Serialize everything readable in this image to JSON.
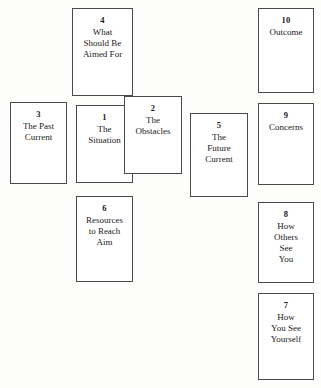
{
  "spread": {
    "background_color": "#fdfdfc",
    "card_border_color": "#4a4a4a",
    "card_fill_color": "#ffffff",
    "text_color": "#1a1a1a",
    "cards": [
      {
        "id": "card-1",
        "number": "1",
        "label": "The\nSituation"
      },
      {
        "id": "card-2",
        "number": "2",
        "label": "The\nObstacles"
      },
      {
        "id": "card-3",
        "number": "3",
        "label": "The Past\nCurrent"
      },
      {
        "id": "card-4",
        "number": "4",
        "label": "What\nShould Be\nAimed For"
      },
      {
        "id": "card-5",
        "number": "5",
        "label": "The\nFuture\nCurrent"
      },
      {
        "id": "card-6",
        "number": "6",
        "label": "Resources\nto Reach\nAim"
      },
      {
        "id": "card-7",
        "number": "7",
        "label": "How\nYou See\nYourself"
      },
      {
        "id": "card-8",
        "number": "8",
        "label": "How\nOthers\nSee\nYou"
      },
      {
        "id": "card-9",
        "number": "9",
        "label": "Concerns"
      },
      {
        "id": "card-10",
        "number": "10",
        "label": "Outcome"
      }
    ]
  }
}
